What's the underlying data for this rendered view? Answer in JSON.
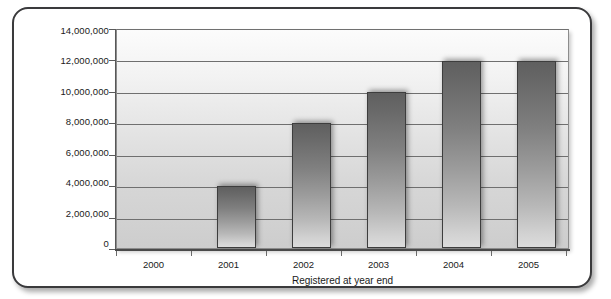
{
  "chart_data": {
    "type": "bar",
    "title": "",
    "subtitle": "",
    "xlabel": "Registered at year end",
    "ylabel": "",
    "categories": [
      "2000",
      "2001",
      "2002",
      "2003",
      "2004",
      "2005"
    ],
    "values": [
      0,
      4000000,
      8000000,
      10000000,
      12000000,
      12000000
    ],
    "series": [
      {
        "name": "Registered at year end",
        "values": [
          0,
          4000000,
          8000000,
          10000000,
          12000000,
          12000000
        ]
      }
    ],
    "ylim": [
      0,
      14000000
    ],
    "ytick_values": [
      0,
      2000000,
      4000000,
      6000000,
      8000000,
      10000000,
      12000000,
      14000000
    ],
    "ytick_labels": [
      "0",
      "2,000,000",
      "4,000,000",
      "6,000,000",
      "8,000,000",
      "10,000,000",
      "12,000,000",
      "14,000,000"
    ],
    "grid": true,
    "grid_axis": "y",
    "legend": false,
    "legend_position": "none",
    "bar_color_top": "#5f5f5f",
    "bar_color_bottom": "#dcdcdc",
    "plot_background_top": "#fcfcfc",
    "plot_background_bottom": "#cdcdcd",
    "frame_color": "#3a3a3c",
    "annotations": []
  },
  "axis": {
    "x_title": "Registered at year end"
  }
}
